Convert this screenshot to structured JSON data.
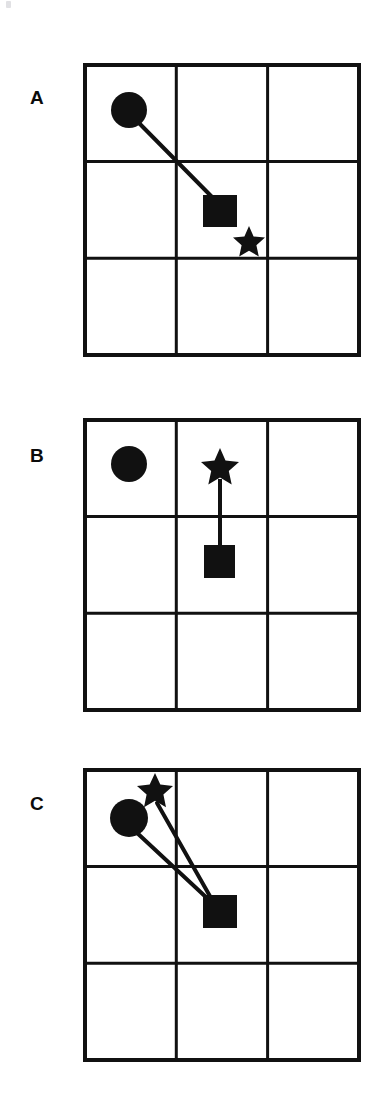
{
  "figure": {
    "caption": "",
    "background_color": "#ffffff",
    "ink_color": "#111111",
    "panel_count": 3,
    "grid": {
      "rows": 3,
      "columns": 3,
      "line_color": "#111111",
      "border_width_px": 4,
      "inner_line_width_px": 3,
      "width_px": 274,
      "height_px": 290,
      "left_px": 83
    },
    "panels": [
      {
        "id": "panel-a",
        "label": "A",
        "label_x": 30,
        "label_y": 88,
        "grid_top": 63,
        "shapes": [
          {
            "type": "circle",
            "name": "circle-marker",
            "cell_row": 0,
            "cell_col": 0,
            "cx": 129,
            "cy": 110,
            "r": 18
          },
          {
            "type": "square",
            "name": "square-marker",
            "cell_row": 1,
            "cell_col": 1,
            "x": 203,
            "y": 195,
            "size": 34
          },
          {
            "type": "star",
            "name": "star-marker",
            "cell_row": 1,
            "cell_col": 1,
            "cx": 249,
            "cy": 241,
            "r": 16
          }
        ],
        "connectors": [
          {
            "name": "connector-circle-square",
            "from": "circle",
            "to": "square",
            "x1": 136,
            "y1": 120,
            "x2": 214,
            "y2": 199
          }
        ]
      },
      {
        "id": "panel-b",
        "label": "B",
        "label_x": 30,
        "label_y": 448,
        "grid_top": 418,
        "shapes": [
          {
            "type": "circle",
            "name": "circle-marker",
            "cell_row": 0,
            "cell_col": 0,
            "cx": 129,
            "cy": 464,
            "r": 18
          },
          {
            "type": "star",
            "name": "star-marker",
            "cell_row": 0,
            "cell_col": 1,
            "cx": 220,
            "cy": 466,
            "r": 19
          },
          {
            "type": "square",
            "name": "square-marker",
            "cell_row": 1,
            "cell_col": 1,
            "x": 204,
            "y": 545,
            "size": 31
          }
        ],
        "connectors": [
          {
            "name": "connector-star-square",
            "from": "star",
            "to": "square",
            "x1": 220,
            "y1": 479,
            "x2": 220,
            "y2": 548
          }
        ]
      },
      {
        "id": "panel-c",
        "label": "C",
        "label_x": 30,
        "label_y": 795,
        "grid_top": 768,
        "shapes": [
          {
            "type": "star",
            "name": "star-marker",
            "cell_row": 0,
            "cell_col": 0,
            "cx": 155,
            "cy": 789,
            "r": 18
          },
          {
            "type": "circle",
            "name": "circle-marker",
            "cell_row": 0,
            "cell_col": 0,
            "cx": 129,
            "cy": 818,
            "r": 19
          },
          {
            "type": "square",
            "name": "square-marker",
            "cell_row": 1,
            "cell_col": 1,
            "x": 203,
            "y": 895,
            "size": 34
          }
        ],
        "connectors": [
          {
            "name": "connector-star-square",
            "from": "star",
            "to": "square",
            "x1": 157,
            "y1": 803,
            "x2": 211,
            "y2": 898
          },
          {
            "name": "connector-circle-square",
            "from": "circle",
            "to": "square",
            "x1": 135,
            "y1": 831,
            "x2": 208,
            "y2": 899
          }
        ]
      }
    ]
  }
}
